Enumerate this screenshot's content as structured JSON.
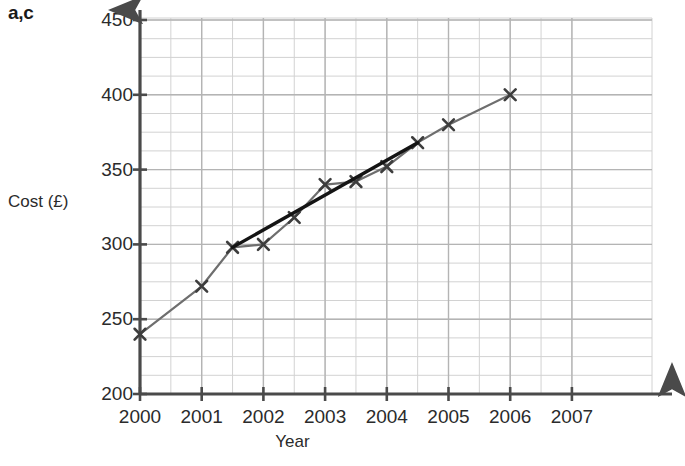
{
  "annotation": {
    "corner_label": "a,c"
  },
  "chart_data": {
    "type": "line",
    "title": "",
    "xlabel": "Year",
    "ylabel": "Cost (£)",
    "xlim": [
      2000,
      2007
    ],
    "ylim": [
      200,
      450
    ],
    "xticks": [
      "2000",
      "2001",
      "2002",
      "2003",
      "2004",
      "2005",
      "2006",
      "2007"
    ],
    "xtick_values": [
      2000,
      2001,
      2002,
      2003,
      2004,
      2005,
      2006,
      2007
    ],
    "yticks": [
      "200",
      "250",
      "300",
      "350",
      "400",
      "450"
    ],
    "ytick_values": [
      200,
      250,
      300,
      350,
      400,
      450
    ],
    "grid": true,
    "grid_minor_x_step": 0.5,
    "grid_minor_y_step": 12.5,
    "legend": "none",
    "series": [
      {
        "name": "Cost data",
        "type": "line-with-markers",
        "marker": "x",
        "color": "#6e6e6e",
        "x": [
          2000,
          2001,
          2001.5,
          2002,
          2002.5,
          2003,
          2003.5,
          2004,
          2004.5,
          2005,
          2006
        ],
        "values": [
          240,
          272,
          298,
          300,
          318,
          340,
          342,
          352,
          368,
          380,
          400
        ]
      },
      {
        "name": "Line of best fit",
        "type": "line",
        "marker": "none",
        "color": "#141414",
        "x": [
          2001.5,
          2004.5
        ],
        "values": [
          298,
          368
        ]
      }
    ]
  }
}
